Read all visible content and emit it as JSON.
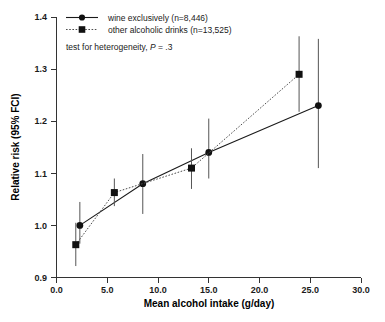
{
  "chart_data": {
    "type": "line",
    "title": "",
    "xlabel": "Mean alcohol intake (g/day)",
    "ylabel": "Relative risk (95% FCI)",
    "xlim": [
      0.0,
      30.0
    ],
    "ylim": [
      0.9,
      1.4
    ],
    "xticks": [
      "0.0",
      "5.0",
      "10.0",
      "15.0",
      "20.0",
      "25.0",
      "30.0"
    ],
    "xtick_values": [
      0.0,
      5.0,
      10.0,
      15.0,
      20.0,
      25.0,
      30.0
    ],
    "yticks": [
      "0.9",
      "1.0",
      "1.1",
      "1.2",
      "1.3",
      "1.4"
    ],
    "ytick_values": [
      0.9,
      1.0,
      1.1,
      1.2,
      1.3,
      1.4
    ],
    "grid": false,
    "legend_position": "top-left",
    "annotation": "test for heterogeneity, P = .3",
    "series": [
      {
        "name": "wine exclusively (n=8,446)",
        "marker": "circle",
        "linestyle": "solid",
        "color": "#111111",
        "points": [
          {
            "x": 2.3,
            "y": 1.0,
            "ci_low": 0.965,
            "ci_high": 1.045
          },
          {
            "x": 8.5,
            "y": 1.08,
            "ci_low": 1.022,
            "ci_high": 1.137
          },
          {
            "x": 15.0,
            "y": 1.14,
            "ci_low": 1.09,
            "ci_high": 1.205
          },
          {
            "x": 25.8,
            "y": 1.23,
            "ci_low": 1.11,
            "ci_high": 1.358
          }
        ]
      },
      {
        "name": "other alcoholic drinks (n=13,525)",
        "marker": "square",
        "linestyle": "dotted",
        "color": "#111111",
        "points": [
          {
            "x": 1.9,
            "y": 0.963,
            "ci_low": 0.922,
            "ci_high": 1.005
          },
          {
            "x": 5.7,
            "y": 1.063,
            "ci_low": 1.037,
            "ci_high": 1.09
          },
          {
            "x": 13.3,
            "y": 1.11,
            "ci_low": 1.07,
            "ci_high": 1.148
          },
          {
            "x": 23.9,
            "y": 1.29,
            "ci_low": 1.218,
            "ci_high": 1.363
          }
        ]
      }
    ]
  },
  "legend": {
    "items": [
      {
        "label": "wine exclusively (n=8,446)",
        "marker": "circle",
        "linestyle": "solid"
      },
      {
        "label": "other alcoholic drinks (n=13,525)",
        "marker": "square",
        "linestyle": "dotted"
      }
    ],
    "note_prefix": "test for heterogeneity, ",
    "note_italic": "P",
    "note_suffix": " = .3"
  }
}
